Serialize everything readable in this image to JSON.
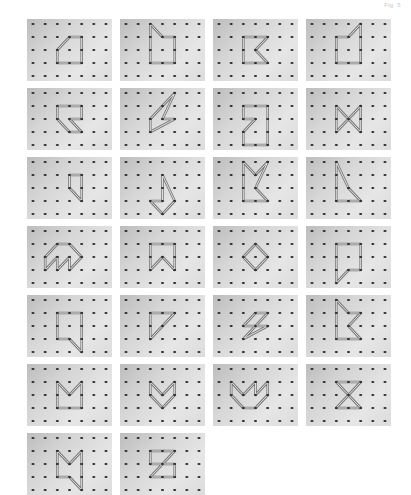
{
  "corner_label": "Fig. 5",
  "board": {
    "cols": 7,
    "rows": 5,
    "panel_width": 85,
    "panel_height": 62,
    "col_pitch": 93,
    "row_pitch": 69,
    "columns": 4
  },
  "colors": {
    "band": "#7a7a7a",
    "band_inner": "#e8e8e8",
    "peg": "#2a2a2a"
  },
  "panels": [
    {
      "id": 1,
      "shape": [
        [
          3,
          1
        ],
        [
          4,
          1
        ],
        [
          4,
          3
        ],
        [
          2,
          3
        ],
        [
          2,
          2
        ]
      ]
    },
    {
      "id": 2,
      "shape": [
        [
          2,
          0
        ],
        [
          3,
          1
        ],
        [
          4,
          1
        ],
        [
          4,
          3
        ],
        [
          2,
          3
        ]
      ]
    },
    {
      "id": 3,
      "shape": [
        [
          2,
          1
        ],
        [
          4,
          1
        ],
        [
          3,
          2
        ],
        [
          4,
          3
        ],
        [
          2,
          3
        ]
      ]
    },
    {
      "id": 4,
      "shape": [
        [
          2,
          1
        ],
        [
          3,
          1
        ],
        [
          4,
          0
        ],
        [
          4,
          3
        ],
        [
          2,
          3
        ]
      ]
    },
    {
      "id": 5,
      "shape": [
        [
          2,
          1
        ],
        [
          4,
          1
        ],
        [
          4,
          2
        ],
        [
          3,
          2
        ],
        [
          4,
          3
        ],
        [
          3,
          3
        ],
        [
          2,
          2
        ]
      ]
    },
    {
      "id": 6,
      "shape": [
        [
          2,
          2
        ],
        [
          4,
          0
        ],
        [
          3,
          2
        ],
        [
          4,
          2
        ],
        [
          2,
          3
        ]
      ]
    },
    {
      "id": 7,
      "shape": [
        [
          2,
          1
        ],
        [
          4,
          1
        ],
        [
          4,
          4
        ],
        [
          2,
          4
        ],
        [
          2,
          3
        ],
        [
          3,
          2
        ],
        [
          2,
          2
        ]
      ]
    },
    {
      "id": 8,
      "shape": [
        [
          2,
          1
        ],
        [
          3,
          2
        ],
        [
          4,
          1
        ],
        [
          4,
          3
        ],
        [
          3,
          2
        ],
        [
          2,
          3
        ]
      ]
    },
    {
      "id": 9,
      "shape": [
        [
          3,
          1
        ],
        [
          4,
          1
        ],
        [
          4,
          3
        ],
        [
          3,
          2
        ]
      ]
    },
    {
      "id": 10,
      "shape": [
        [
          3,
          1
        ],
        [
          4,
          3
        ],
        [
          3,
          4
        ],
        [
          2,
          3
        ],
        [
          3,
          3
        ]
      ]
    },
    {
      "id": 11,
      "shape": [
        [
          2,
          0
        ],
        [
          3,
          1
        ],
        [
          4,
          0
        ],
        [
          3,
          2
        ],
        [
          4,
          3
        ],
        [
          2,
          3
        ]
      ]
    },
    {
      "id": 12,
      "shape": [
        [
          2,
          0
        ],
        [
          3,
          2
        ],
        [
          4,
          3
        ],
        [
          2,
          3
        ]
      ]
    },
    {
      "id": 13,
      "shape": [
        [
          1,
          2
        ],
        [
          2,
          1
        ],
        [
          3,
          1
        ],
        [
          4,
          2
        ],
        [
          3,
          3
        ],
        [
          3,
          2
        ],
        [
          2,
          3
        ],
        [
          2,
          2
        ],
        [
          1,
          3
        ]
      ]
    },
    {
      "id": 14,
      "shape": [
        [
          2,
          1
        ],
        [
          4,
          1
        ],
        [
          4,
          3
        ],
        [
          3,
          2
        ],
        [
          2,
          3
        ]
      ]
    },
    {
      "id": 15,
      "shape": [
        [
          3,
          1
        ],
        [
          4,
          2
        ],
        [
          3,
          3
        ],
        [
          2,
          2
        ]
      ]
    },
    {
      "id": 16,
      "shape": [
        [
          2,
          1
        ],
        [
          4,
          1
        ],
        [
          4,
          3
        ],
        [
          3,
          3
        ],
        [
          2,
          4
        ]
      ]
    },
    {
      "id": 17,
      "shape": [
        [
          2,
          1
        ],
        [
          4,
          1
        ],
        [
          4,
          4
        ],
        [
          3,
          3
        ],
        [
          2,
          3
        ]
      ]
    },
    {
      "id": 18,
      "shape": [
        [
          2,
          1
        ],
        [
          4,
          1
        ],
        [
          2,
          3
        ]
      ]
    },
    {
      "id": 19,
      "shape": [
        [
          3,
          1
        ],
        [
          4,
          1
        ],
        [
          3,
          2
        ],
        [
          4,
          2
        ],
        [
          2,
          3
        ],
        [
          3,
          2
        ],
        [
          2,
          2
        ]
      ]
    },
    {
      "id": 20,
      "shape": [
        [
          2,
          0
        ],
        [
          3,
          1
        ],
        [
          4,
          1
        ],
        [
          3,
          2
        ],
        [
          4,
          3
        ],
        [
          2,
          3
        ]
      ]
    },
    {
      "id": 21,
      "shape": [
        [
          2,
          1
        ],
        [
          3,
          2
        ],
        [
          4,
          1
        ],
        [
          4,
          3
        ],
        [
          2,
          3
        ]
      ]
    },
    {
      "id": 22,
      "shape": [
        [
          2,
          1
        ],
        [
          3,
          2
        ],
        [
          4,
          1
        ],
        [
          4,
          2
        ],
        [
          3,
          3
        ],
        [
          2,
          2
        ]
      ]
    },
    {
      "id": 23,
      "shape": [
        [
          1,
          1
        ],
        [
          2,
          2
        ],
        [
          3,
          1
        ],
        [
          3,
          2
        ],
        [
          4,
          1
        ],
        [
          4,
          2
        ],
        [
          3,
          3
        ],
        [
          2,
          3
        ],
        [
          1,
          2
        ]
      ]
    },
    {
      "id": 24,
      "shape": [
        [
          2,
          1
        ],
        [
          4,
          1
        ],
        [
          2,
          3
        ],
        [
          4,
          3
        ]
      ]
    },
    {
      "id": 25,
      "shape": [
        [
          2,
          1
        ],
        [
          3,
          2
        ],
        [
          4,
          1
        ],
        [
          4,
          4
        ],
        [
          3,
          3
        ],
        [
          2,
          3
        ]
      ]
    },
    {
      "id": 26,
      "shape": [
        [
          2,
          1
        ],
        [
          4,
          1
        ],
        [
          2,
          3
        ],
        [
          4,
          3
        ],
        [
          4,
          2
        ],
        [
          2,
          2
        ]
      ]
    }
  ]
}
